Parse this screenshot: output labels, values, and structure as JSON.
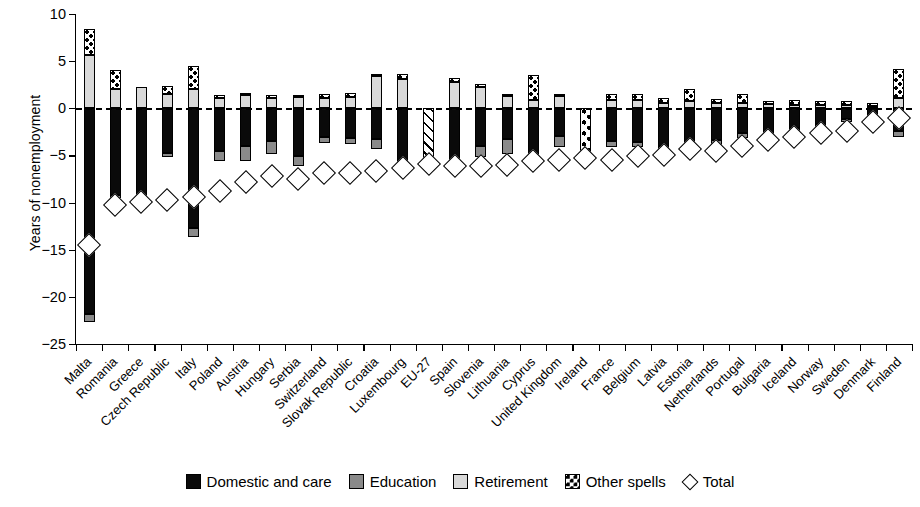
{
  "chart_data": {
    "type": "bar",
    "subtype": "stacked-bar-with-total-marker",
    "title": "",
    "xlabel": "",
    "ylabel": "Years of nonemployment",
    "ylim": [
      -25,
      10
    ],
    "yticks": [
      10,
      5,
      0,
      -5,
      -10,
      -15,
      -20,
      -25
    ],
    "ytick_labels": [
      "10",
      "5",
      "0",
      "−5",
      "−10",
      "−15",
      "−20",
      "−25"
    ],
    "grid": false,
    "zero_reference_line": true,
    "legend_position": "bottom",
    "legend": [
      {
        "key": "domestic",
        "label": "Domestic and care",
        "swatch": "black"
      },
      {
        "key": "education",
        "label": "Education",
        "swatch": "dark-gray"
      },
      {
        "key": "retirement",
        "label": "Retirement",
        "swatch": "light-gray"
      },
      {
        "key": "other",
        "label": "Other spells",
        "swatch": "dotted"
      },
      {
        "key": "total",
        "label": "Total",
        "swatch": "open-diamond"
      }
    ],
    "categories": [
      "Malta",
      "Romania",
      "Greece",
      "Czech Republic",
      "Italy",
      "Poland",
      "Austria",
      "Hungary",
      "Serbia",
      "Switzerland",
      "Slovak Republic",
      "Croatia",
      "Luxembourg",
      "EU-27",
      "Spain",
      "Slovenia",
      "Lithuania",
      "Cyprus",
      "United Kingdom",
      "Ireland",
      "France",
      "Belgium",
      "Latvia",
      "Estonia",
      "Netherlands",
      "Portugal",
      "Bulgaria",
      "Iceland",
      "Norway",
      "Sweden",
      "Denmark",
      "Finland"
    ],
    "series": [
      {
        "name": "Domestic and care",
        "key": "domestic",
        "values": [
          -21.8,
          -9.2,
          -10.6,
          -4.7,
          -12.7,
          -4.5,
          -4.0,
          -3.5,
          -5.1,
          -3.0,
          -3.2,
          -3.3,
          -5.9,
          0.0,
          -6.0,
          -4.0,
          -3.3,
          -5.3,
          -2.9,
          0.0,
          -3.5,
          -3.6,
          -4.0,
          -4.2,
          -3.4,
          -2.6,
          -2.9,
          -2.1,
          -1.7,
          -1.1,
          -0.6,
          -2.4
        ]
      },
      {
        "name": "Education",
        "key": "education",
        "values": [
          -0.9,
          -0.3,
          0.0,
          -0.5,
          -0.9,
          -1.1,
          -1.6,
          -1.3,
          -1.0,
          -0.7,
          -0.6,
          -1.0,
          -0.4,
          0.0,
          -0.4,
          -1.2,
          -1.5,
          -0.7,
          -1.2,
          0.0,
          -0.6,
          -0.5,
          -0.4,
          -0.6,
          -0.5,
          -0.5,
          -0.3,
          -0.4,
          -0.3,
          -0.4,
          -0.3,
          -0.6
        ]
      },
      {
        "name": "Retirement",
        "key": "retirement",
        "values": [
          5.6,
          2.0,
          2.3,
          1.5,
          2.0,
          1.1,
          1.4,
          1.1,
          1.2,
          1.1,
          1.2,
          3.4,
          3.1,
          0.0,
          2.8,
          2.3,
          1.3,
          0.9,
          1.3,
          0.0,
          0.9,
          0.9,
          0.6,
          0.8,
          0.6,
          0.6,
          0.5,
          0.3,
          0.3,
          0.3,
          0.2,
          1.1
        ]
      },
      {
        "name": "Other spells",
        "key": "other",
        "values": [
          2.8,
          2.1,
          0.0,
          0.9,
          2.5,
          0.3,
          0.2,
          0.3,
          0.2,
          0.4,
          0.4,
          0.2,
          0.5,
          0.0,
          0.4,
          0.3,
          0.2,
          2.6,
          0.2,
          -5.9,
          0.6,
          0.6,
          0.5,
          1.2,
          0.4,
          0.9,
          0.3,
          0.6,
          0.5,
          0.5,
          0.4,
          3.1
        ]
      }
    ],
    "total_marker": {
      "name": "Total",
      "values": [
        -14.5,
        -10.3,
        -9.9,
        -9.7,
        -9.4,
        -8.8,
        -7.8,
        -7.2,
        -7.5,
        -6.9,
        -6.9,
        -6.6,
        -6.3,
        -5.9,
        -6.1,
        -6.1,
        -6.0,
        -5.6,
        -5.5,
        -5.3,
        -5.5,
        -5.1,
        -5.0,
        -4.3,
        -4.5,
        -4.0,
        -3.4,
        -3.0,
        -2.6,
        -2.4,
        -1.5,
        -1.0
      ]
    },
    "notes": {
      "eu27_pattern": "diagonal-hatch",
      "ireland_pattern": "dotted-extends-below-zero"
    }
  }
}
